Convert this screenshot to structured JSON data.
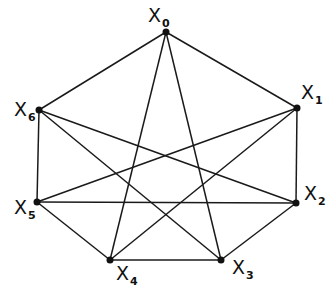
{
  "diagram": {
    "type": "graph",
    "nodes": [
      {
        "id": "X0",
        "letter": "X",
        "sub": "0",
        "x": 166,
        "y": 32,
        "lx": 148,
        "ly": 22
      },
      {
        "id": "X1",
        "letter": "X",
        "sub": "1",
        "x": 297,
        "y": 108,
        "lx": 301,
        "ly": 99
      },
      {
        "id": "X2",
        "letter": "X",
        "sub": "2",
        "x": 296,
        "y": 203,
        "lx": 304,
        "ly": 200
      },
      {
        "id": "X3",
        "letter": "X",
        "sub": "3",
        "x": 221,
        "y": 260,
        "lx": 232,
        "ly": 274
      },
      {
        "id": "X4",
        "letter": "X",
        "sub": "4",
        "x": 110,
        "y": 260,
        "lx": 116,
        "ly": 280
      },
      {
        "id": "X5",
        "letter": "X",
        "sub": "5",
        "x": 37,
        "y": 202,
        "lx": 14,
        "ly": 214
      },
      {
        "id": "X6",
        "letter": "X",
        "sub": "6",
        "x": 39,
        "y": 110,
        "lx": 14,
        "ly": 116
      }
    ],
    "edges": [
      [
        "X0",
        "X1"
      ],
      [
        "X1",
        "X2"
      ],
      [
        "X2",
        "X3"
      ],
      [
        "X3",
        "X4"
      ],
      [
        "X4",
        "X5"
      ],
      [
        "X5",
        "X6"
      ],
      [
        "X6",
        "X0"
      ],
      [
        "X0",
        "X3"
      ],
      [
        "X0",
        "X4"
      ],
      [
        "X6",
        "X3"
      ],
      [
        "X6",
        "X2"
      ],
      [
        "X5",
        "X1"
      ],
      [
        "X5",
        "X2"
      ],
      [
        "X4",
        "X1"
      ]
    ]
  }
}
